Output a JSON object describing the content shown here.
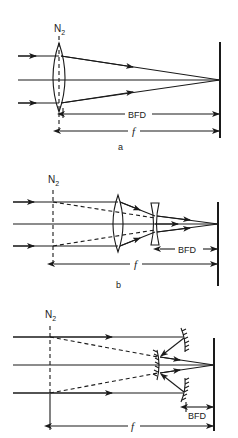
{
  "figure": {
    "panels": [
      {
        "id": "a",
        "caption": "a",
        "plane_label": "N",
        "plane_subscript": "2",
        "bfd_label": "BFD",
        "focal_label": "f",
        "elements": [
          "single convex lens",
          "focal plane"
        ]
      },
      {
        "id": "b",
        "caption": "b",
        "plane_label": "N",
        "plane_subscript": "2",
        "bfd_label": "BFD",
        "focal_label": "f",
        "elements": [
          "positive lens",
          "negative lens",
          "focal plane"
        ]
      },
      {
        "id": "c",
        "caption": "",
        "plane_label": "N",
        "plane_subscript": "2",
        "bfd_label": "BFD",
        "focal_label": "f",
        "elements": [
          "primary mirror",
          "secondary mirror",
          "focal plane"
        ]
      }
    ]
  }
}
